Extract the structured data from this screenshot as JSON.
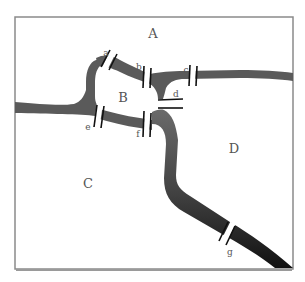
{
  "diagram": {
    "regions": [
      {
        "id": "A",
        "label": "A",
        "x": 153,
        "y": 38
      },
      {
        "id": "B",
        "label": "B",
        "x": 123,
        "y": 102
      },
      {
        "id": "C",
        "label": "C",
        "x": 88,
        "y": 188
      },
      {
        "id": "D",
        "label": "D",
        "x": 234,
        "y": 153
      }
    ],
    "bridges": [
      {
        "id": "a",
        "label": "a",
        "x": 106,
        "y": 56
      },
      {
        "id": "b",
        "label": "b",
        "x": 139,
        "y": 70
      },
      {
        "id": "c",
        "label": "c",
        "x": 186,
        "y": 73
      },
      {
        "id": "d",
        "label": "d",
        "x": 176,
        "y": 97
      },
      {
        "id": "e",
        "label": "e",
        "x": 88,
        "y": 130
      },
      {
        "id": "f",
        "label": "f",
        "x": 138,
        "y": 137
      },
      {
        "id": "g",
        "label": "g",
        "x": 230,
        "y": 255
      }
    ],
    "colors": {
      "river_light": "#666666",
      "river_dark": "#1a1a1a",
      "land": "#ffffff",
      "border": "#888888",
      "bridge": "#111111",
      "text": "#555555"
    }
  }
}
